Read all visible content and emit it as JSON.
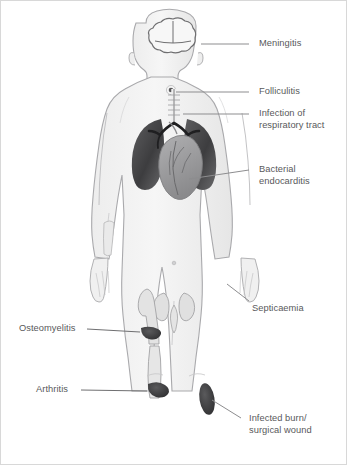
{
  "figure": {
    "background_color": "#ffffff",
    "border_color": "#d8d8d8",
    "label_color": "#59595b",
    "leader_color": "#8d8d8f",
    "body_fill": "#f2f2f2",
    "body_outline": "#a9a9ac",
    "bone_fill": "#e3e3e3",
    "organ_dark": "#4c4c4e",
    "organ_mid": "#9a9a9c",
    "lesion_dark": "#3f3f41"
  },
  "labels": [
    {
      "id": "meningitis",
      "text": "Meningitis",
      "side": "right",
      "x": 258,
      "y": 37,
      "leader": {
        "x1": 248,
        "y1": 43,
        "x2": 200,
        "y2": 43
      }
    },
    {
      "id": "folliculitis",
      "text": "Folliculitis",
      "side": "right",
      "x": 258,
      "y": 85,
      "leader": {
        "x1": 248,
        "y1": 91,
        "x2": 175,
        "y2": 91
      }
    },
    {
      "id": "infection-of-respiratory-tract",
      "text": "Infection of\nrespiratory tract",
      "side": "right",
      "x": 258,
      "y": 107,
      "leader": {
        "x1": 248,
        "y1": 113,
        "x2": 182,
        "y2": 113
      }
    },
    {
      "id": "bacterial-endocarditis",
      "text": "Bacterial\nendocarditis",
      "side": "right",
      "x": 258,
      "y": 163,
      "leader": {
        "x1": 248,
        "y1": 169,
        "x2": 188,
        "y2": 178
      }
    },
    {
      "id": "septicaemia",
      "text": "Septicaemia",
      "side": "right",
      "x": 251,
      "y": 302,
      "leader": {
        "x1": 248,
        "y1": 300,
        "x2": 226,
        "y2": 283
      }
    },
    {
      "id": "infected-burn-surgical-wound",
      "text": "Infected burn/\nsurgical wound",
      "side": "right",
      "x": 248,
      "y": 412,
      "leader": {
        "x1": 240,
        "y1": 417,
        "x2": 211,
        "y2": 399
      }
    },
    {
      "id": "osteomyelitis",
      "text": "Osteomyelitis",
      "side": "left",
      "x": 18,
      "y": 322,
      "leader": {
        "x1": 86,
        "y1": 328,
        "x2": 139,
        "y2": 331
      }
    },
    {
      "id": "arthritis",
      "text": "Arthritis",
      "side": "left",
      "x": 35,
      "y": 383,
      "leader": {
        "x1": 80,
        "y1": 389,
        "x2": 146,
        "y2": 390
      }
    }
  ],
  "body_parts": [
    {
      "id": "brain",
      "name": "brain-meninges"
    },
    {
      "id": "hair-follicle",
      "name": "neck-follicle-lesion"
    },
    {
      "id": "trachea-bronchi",
      "name": "trachea-and-bronchi"
    },
    {
      "id": "lungs",
      "name": "lungs"
    },
    {
      "id": "heart",
      "name": "heart"
    },
    {
      "id": "pelvis",
      "name": "pelvis"
    },
    {
      "id": "femur",
      "name": "femur-bone"
    },
    {
      "id": "femur-lesion",
      "name": "femur-osteomyelitis-lesion"
    },
    {
      "id": "knee-lesion",
      "name": "knee-arthritis-lesion"
    },
    {
      "id": "thigh-wound",
      "name": "thigh-burn-wound-lesion"
    },
    {
      "id": "umbilicus",
      "name": "umbilicus"
    }
  ]
}
